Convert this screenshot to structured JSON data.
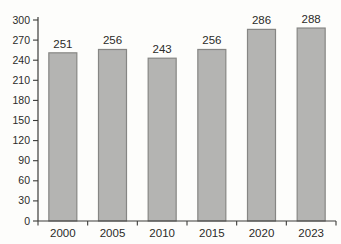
{
  "chart_data": {
    "type": "bar",
    "title": "",
    "xlabel": "",
    "ylabel": "",
    "categories": [
      "2000",
      "2005",
      "2010",
      "2015",
      "2020",
      "2023"
    ],
    "values": [
      251,
      256,
      243,
      256,
      286,
      288
    ],
    "value_labels": [
      "251",
      "256",
      "243",
      "256",
      "286",
      "288"
    ],
    "ylim": [
      0,
      300
    ],
    "ytick_step": 30,
    "yticks": [
      0,
      30,
      60,
      90,
      120,
      150,
      180,
      210,
      240,
      270,
      300
    ],
    "grid": false,
    "legend_position": "none",
    "colors": {
      "bar_fill": "#b4b4b2",
      "bar_stroke": "#868684",
      "axis": "#3c3c3a",
      "text": "#2b2b29",
      "background": "#fdfdfb"
    }
  }
}
